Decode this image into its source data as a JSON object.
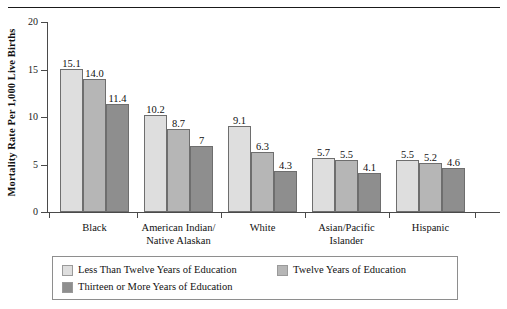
{
  "chart_data": {
    "type": "bar",
    "title": "",
    "xlabel": "",
    "ylabel": "Mortality Rate Per 1,000 Live Births",
    "ylim": [
      0,
      20
    ],
    "yticks": [
      0,
      5,
      10,
      15,
      20
    ],
    "grid": false,
    "legend_position": "bottom",
    "categories": [
      "Black",
      "American Indian/\nNative Alaskan",
      "White",
      "Asian/Pacific\nIslander",
      "Hispanic"
    ],
    "category_lines": [
      [
        "Black"
      ],
      [
        "American Indian/",
        "Native Alaskan"
      ],
      [
        "White"
      ],
      [
        "Asian/Pacific",
        "Islander"
      ],
      [
        "Hispanic"
      ]
    ],
    "series": [
      {
        "name": "Less Than Twelve Years of Education",
        "color": "#dedede",
        "values": [
          15.1,
          10.2,
          9.1,
          5.7,
          5.5
        ],
        "labels": [
          "15.1",
          "10.2",
          "9.1",
          "5.7",
          "5.5"
        ]
      },
      {
        "name": "Twelve Years of Education",
        "color": "#b6b6b6",
        "values": [
          14.0,
          8.7,
          6.3,
          5.5,
          5.2
        ],
        "labels": [
          "14.0",
          "8.7",
          "6.3",
          "5.5",
          "5.2"
        ]
      },
      {
        "name": "Thirteen or More Years of Education",
        "color": "#8e8e8e",
        "values": [
          11.4,
          7,
          4.3,
          4.1,
          4.6
        ],
        "labels": [
          "11.4",
          "7",
          "4.3",
          "4.1",
          "4.6"
        ]
      }
    ]
  }
}
